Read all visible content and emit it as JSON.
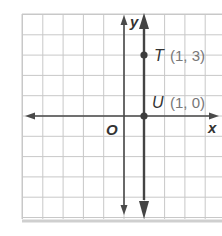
{
  "chart_data": {
    "type": "line",
    "title": "",
    "xlabel": "x",
    "ylabel": "y",
    "origin_label": "O",
    "grid": true,
    "xlim": [
      -5,
      4
    ],
    "ylim": [
      -5,
      5
    ],
    "series": [
      {
        "name": "x = 1",
        "kind": "vertical-line",
        "x_value": 1
      }
    ],
    "points": [
      {
        "name": "T",
        "x": 1,
        "y": 3,
        "label": "T",
        "coord_text": "(1, 3)"
      },
      {
        "name": "U",
        "x": 1,
        "y": 0,
        "label": "U",
        "coord_text": "(1, 0)"
      }
    ]
  },
  "labels": {
    "x_axis": "x",
    "y_axis": "y",
    "origin": "O",
    "point_t_name": "T",
    "point_t_coords": "(1, 3)",
    "point_u_name": "U",
    "point_u_coords": "(1, 0)"
  },
  "colors": {
    "grid": "#c8c8c8",
    "axis": "#4a4a4a",
    "line": "#444444",
    "point": "#3c3c3c"
  }
}
